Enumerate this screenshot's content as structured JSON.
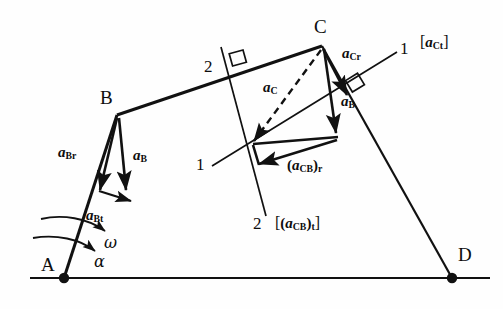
{
  "figure": {
    "type": "kinematic-acceleration-diagram",
    "ink_color": "#111111",
    "background_color": "#fefefe"
  },
  "points": {
    "A": {
      "label": "A",
      "x": 64,
      "y": 278
    },
    "B": {
      "label": "B",
      "x": 117,
      "y": 115
    },
    "C": {
      "label": "C",
      "x": 322,
      "y": 46
    },
    "D": {
      "label": "D",
      "x": 452,
      "y": 278
    }
  },
  "labels": {
    "point_a": "A",
    "point_b": "B",
    "point_c": "C",
    "point_d": "D",
    "line_1_left": "1",
    "line_1_right": "1",
    "line_2_top": "2",
    "line_2_bottom": "2",
    "omega": "ω",
    "alpha": "α"
  },
  "vectors": {
    "a_Br": {
      "base": "a",
      "sub": "Br",
      "name": "normal acceleration of B"
    },
    "a_B_left": {
      "base": "a",
      "sub": "B",
      "name": "total acceleration of B at crank"
    },
    "a_Bt": {
      "base": "a",
      "sub": "Bt",
      "name": "tangential acceleration of B"
    },
    "a_C": {
      "base": "a",
      "sub": "C",
      "name": "total acceleration of C"
    },
    "a_Cr": {
      "base": "a",
      "sub": "Cr",
      "name": "normal acceleration of C"
    },
    "a_B_right": {
      "base": "a",
      "sub": "B",
      "name": "acceleration of B transferred"
    },
    "a_CB_r": {
      "base": "a",
      "sub": "CB",
      "suffix": "r",
      "name": "normal acceleration of C relative to B"
    },
    "a_CB_t": {
      "base": "a",
      "sub": "CB",
      "suffix": "t",
      "name": "tangential acceleration of C relative to B"
    },
    "a_Ct": {
      "base": "a",
      "sub": "Ct",
      "name": "tangential acceleration of C"
    }
  },
  "annotations": {
    "bracket_open": "[",
    "bracket_close": "]",
    "paren_open": "(",
    "paren_close": ")"
  }
}
